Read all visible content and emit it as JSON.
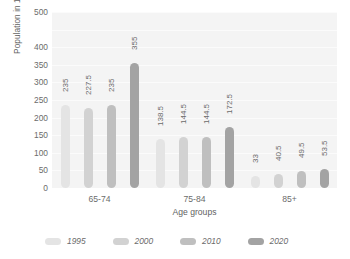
{
  "chart_data": {
    "type": "bar",
    "title": "",
    "xlabel": "Age groups",
    "ylabel": "Population in 1000s",
    "categories": [
      "65-74",
      "75-84",
      "85+"
    ],
    "series": [
      {
        "name": "1995",
        "color": "#e4e4e4",
        "values": [
          235,
          138.5,
          33
        ]
      },
      {
        "name": "2000",
        "color": "#d2d2d2",
        "values": [
          227.5,
          144.5,
          40.5
        ]
      },
      {
        "name": "2010",
        "color": "#bfbfbf",
        "values": [
          235,
          144.5,
          49.5
        ]
      },
      {
        "name": "2020",
        "color": "#a3a3a3",
        "values": [
          355,
          172.5,
          53.5
        ]
      }
    ],
    "value_labels": [
      [
        "235",
        "227.5",
        "235",
        "355"
      ],
      [
        "138.5",
        "144.5",
        "144.5",
        "172.5"
      ],
      [
        "33",
        "40.5",
        "49.5",
        "53.5"
      ]
    ],
    "ylim": [
      0,
      500
    ],
    "ytick_values": [
      500,
      400,
      350,
      300,
      250,
      200,
      150,
      100,
      50,
      0
    ],
    "ytick_labels": [
      "500",
      "400",
      "350",
      "300",
      "250",
      "200",
      "150",
      "100",
      "50",
      "0"
    ],
    "gridlines": [
      500,
      450,
      400,
      350,
      300,
      250,
      200,
      150,
      100,
      50,
      0
    ],
    "grid": true,
    "legend_position": "bottom",
    "plot_background": "#f4f4f4",
    "gridline_color": "#fbfbfb"
  },
  "legend": {
    "entries": [
      {
        "label": "1995"
      },
      {
        "label": "2000"
      },
      {
        "label": "2010"
      },
      {
        "label": "2020"
      }
    ]
  }
}
